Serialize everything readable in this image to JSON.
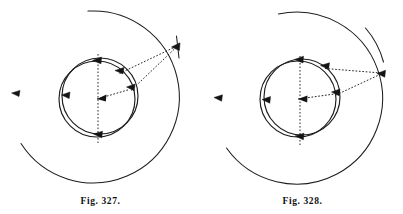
{
  "plate": {
    "background_color": "#ffffff",
    "ink_color": "#1a1a1a",
    "figure_count": 2
  },
  "figures": [
    {
      "id": "fig-327",
      "caption": "Fig. 327.",
      "center": {
        "x": 97,
        "y": 97
      },
      "outer_orbit": {
        "name": "outer-orbit-arc",
        "radius": 86,
        "gap_start_deg": 96,
        "gap_end_deg": 152,
        "marker_angles_deg": [
          330,
          182
        ]
      },
      "inner_orbits": [
        {
          "name": "inner-orbit-primary",
          "radius": 38,
          "cx": 97,
          "cy": 99
        },
        {
          "name": "inner-orbit-secondary",
          "radius": 38,
          "cx": 100,
          "cy": 96
        }
      ],
      "axis": {
        "name": "vertical-dashed-axis",
        "top_y": 54,
        "bottom_y": 142
      },
      "radial_arrow": {
        "name": "radius-vector",
        "angle_deg": 332,
        "length": 38
      },
      "inner_markers_deg": [
        268,
        182,
        300,
        92,
        330
      ],
      "sight_lines": [
        {
          "name": "sight-line-upper",
          "from_deg": 300,
          "to": "outer-marker"
        },
        {
          "name": "sight-line-lower",
          "from_deg": 332,
          "to": "outer-marker"
        }
      ],
      "convergence_marker": {
        "name": "observer-point",
        "angle_deg": 330
      }
    },
    {
      "id": "fig-328",
      "caption": "Fig. 328.",
      "center": {
        "x": 97,
        "y": 97
      },
      "outer_orbit": {
        "name": "outer-orbit-arc",
        "radius": 86,
        "gap_start_deg": 92,
        "gap_end_deg": 160,
        "marker_angles_deg": [
          352,
          182
        ]
      },
      "inner_orbits": [
        {
          "name": "inner-orbit-primary",
          "radius": 38,
          "cx": 96,
          "cy": 99
        },
        {
          "name": "inner-orbit-secondary",
          "radius": 38,
          "cx": 100,
          "cy": 97
        }
      ],
      "axis": {
        "name": "vertical-dashed-axis",
        "top_y": 54,
        "bottom_y": 142
      },
      "radial_arrow": {
        "name": "radius-vector",
        "angle_deg": 348,
        "length": 38
      },
      "inner_markers_deg": [
        268,
        182,
        312,
        92,
        350
      ],
      "sight_lines": [
        {
          "name": "sight-line-upper",
          "from_deg": 312,
          "to": "outer-marker"
        },
        {
          "name": "sight-line-lower",
          "from_deg": 348,
          "to": "outer-marker"
        }
      ],
      "convergence_marker": {
        "name": "observer-point",
        "angle_deg": 352
      }
    }
  ]
}
